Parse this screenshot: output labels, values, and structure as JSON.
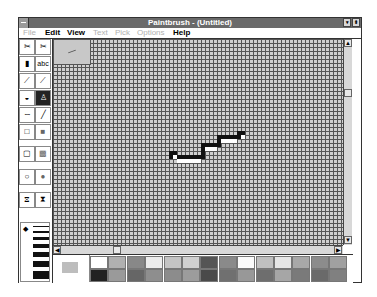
{
  "window": {
    "title": "Paintbrush - (Untitled)",
    "minimize_glyph": "▾",
    "maximize_glyph": "⬍"
  },
  "menu": [
    {
      "label": "File",
      "enabled": false
    },
    {
      "label": "Edit",
      "enabled": true
    },
    {
      "label": "View",
      "enabled": true
    },
    {
      "label": "Text",
      "enabled": false
    },
    {
      "label": "Pick",
      "enabled": false
    },
    {
      "label": "Options",
      "enabled": false
    },
    {
      "label": "Help",
      "enabled": true
    }
  ],
  "tools": [
    {
      "name": "scissors-select",
      "glyph": "✂"
    },
    {
      "name": "pick-select",
      "glyph": "✂"
    },
    {
      "name": "airbrush",
      "glyph": "▮"
    },
    {
      "name": "text",
      "glyph": "abc"
    },
    {
      "name": "color-eraser",
      "glyph": "⟋"
    },
    {
      "name": "eraser",
      "glyph": "⟋"
    },
    {
      "name": "paint-roller",
      "glyph": "◒"
    },
    {
      "name": "brush",
      "glyph": "♙"
    },
    {
      "name": "curve",
      "glyph": "∽"
    },
    {
      "name": "line",
      "glyph": "╱"
    },
    {
      "name": "box",
      "glyph": "□"
    },
    {
      "name": "filled-box",
      "glyph": "■"
    },
    {
      "name": "rounded-box",
      "glyph": "▢"
    },
    {
      "name": "filled-rounded-box",
      "glyph": "▩"
    },
    {
      "name": "circle",
      "glyph": "○"
    },
    {
      "name": "filled-circle",
      "glyph": "●"
    },
    {
      "name": "polygon",
      "glyph": "⧖"
    },
    {
      "name": "filled-polygon",
      "glyph": "⧗"
    }
  ],
  "selected_tool": "brush",
  "line_sizes": [
    1,
    2,
    3,
    4,
    5,
    6,
    8
  ],
  "scroll": {
    "up": "▲",
    "down": "▼",
    "left": "◀",
    "right": "▶"
  },
  "palette": {
    "foreground": "#000000",
    "background": "#bdbdbd",
    "top_row": [
      "#ffffff",
      "#b0b0b0",
      "#888888",
      "#ececec",
      "#c4c4c4",
      "#d0d0d0",
      "#555555",
      "#8a8a8a",
      "#fafafa",
      "#c0c0c0",
      "#e6e6e6",
      "#a8a8a8",
      "#8c8c8c",
      "#a0a0a0"
    ],
    "bottom_row": [
      "#222222",
      "#9a9a9a",
      "#666666",
      "#8e8e8e",
      "#8c8c8c",
      "#9c9c9c",
      "#4a4a4a",
      "#707070",
      "#989898",
      "#6e6e6e",
      "#a6a6a6",
      "#7a7a7a",
      "#6a6a6a",
      "#808080"
    ]
  }
}
